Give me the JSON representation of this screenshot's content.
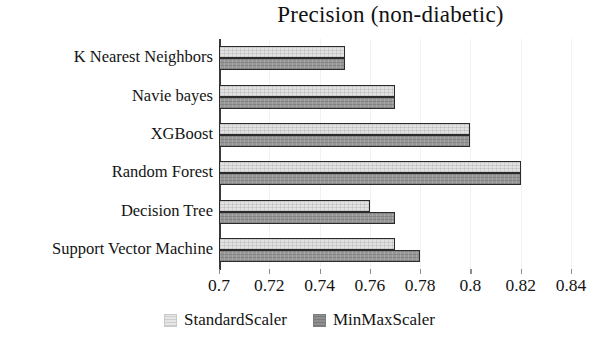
{
  "chart_data": {
    "type": "bar",
    "orientation": "horizontal",
    "title": "Precision (non-diabetic)",
    "xlabel": "",
    "ylabel": "",
    "xlim": [
      0.7,
      0.84
    ],
    "xticks": [
      "0.7",
      "0.72",
      "0.74",
      "0.76",
      "0.78",
      "0.8",
      "0.82",
      "0.84"
    ],
    "xtick_values": [
      0.7,
      0.72,
      0.74,
      0.76,
      0.78,
      0.8,
      0.82,
      0.84
    ],
    "grid": false,
    "legend_position": "bottom-center",
    "categories": [
      "K Nearest Neighbors",
      "Navie bayes",
      "XGBoost",
      "Random Forest",
      "Decision Tree",
      "Support Vector Machine"
    ],
    "series": [
      {
        "name": "StandardScaler",
        "color": "#e2e2e2",
        "values": [
          0.75,
          0.77,
          0.8,
          0.82,
          0.76,
          0.77
        ]
      },
      {
        "name": "MinMaxScaler",
        "color": "#979797",
        "values": [
          0.75,
          0.77,
          0.8,
          0.82,
          0.77,
          0.78
        ]
      }
    ]
  },
  "legend": {
    "items": [
      {
        "label": "StandardScaler",
        "swatch": "standard"
      },
      {
        "label": "MinMaxScaler",
        "swatch": "minmax"
      }
    ]
  }
}
